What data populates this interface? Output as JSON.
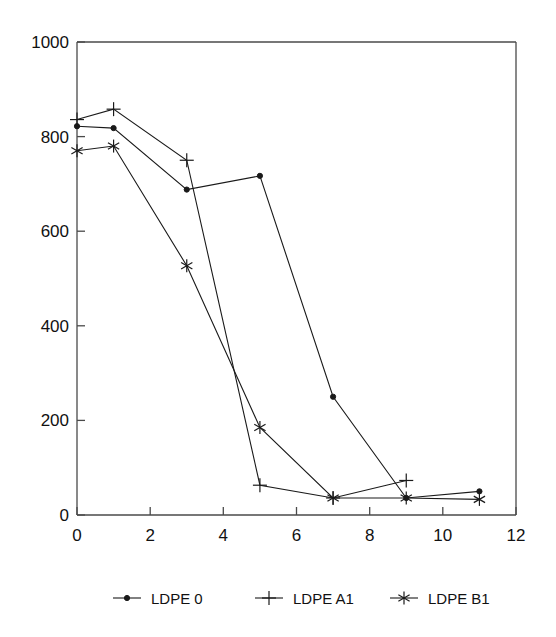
{
  "chart_data": {
    "type": "line",
    "title": "",
    "xlabel": "",
    "ylabel": "",
    "xlim": [
      0,
      12
    ],
    "ylim": [
      0,
      1000
    ],
    "xticks": [
      0,
      2,
      4,
      6,
      8,
      10,
      12
    ],
    "yticks": [
      0,
      200,
      400,
      600,
      800,
      1000
    ],
    "xtick_labels": [
      "0",
      "2",
      "4",
      "6",
      "8",
      "10",
      "12"
    ],
    "ytick_labels": [
      "0",
      "200",
      "400",
      "600",
      "800",
      "1000"
    ],
    "grid": false,
    "legend_position": "below",
    "series": [
      {
        "name": "LDPE 0",
        "marker": "dot",
        "x": [
          0,
          1,
          3,
          5,
          7,
          9,
          11
        ],
        "values": [
          822,
          818,
          688,
          717,
          250,
          36,
          50
        ]
      },
      {
        "name": "LDPE A1",
        "marker": "plus",
        "x": [
          0,
          1,
          3,
          5,
          7,
          9
        ],
        "values": [
          836,
          858,
          750,
          63,
          36,
          73
        ]
      },
      {
        "name": "LDPE B1",
        "marker": "star",
        "x": [
          0,
          1,
          3,
          5,
          7,
          9,
          11
        ],
        "values": [
          770,
          780,
          527,
          185,
          36,
          36,
          33
        ]
      }
    ]
  },
  "legend": {
    "entries": [
      {
        "label": "LDPE 0",
        "marker": "dot-marker-icon"
      },
      {
        "label": "LDPE A1",
        "marker": "plus-marker-icon"
      },
      {
        "label": "LDPE B1",
        "marker": "star-marker-icon"
      }
    ]
  },
  "colors": {
    "series_stroke": "#1a1a1a",
    "axis": "#4a4a4a",
    "text": "#111111",
    "background": "#ffffff"
  }
}
